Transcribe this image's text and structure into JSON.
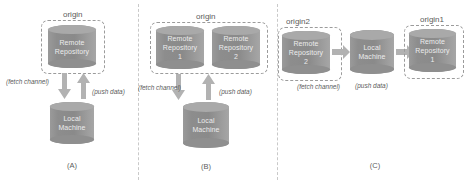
{
  "figure": {
    "background": "#ffffff",
    "cylinder_color": "#8a8a8a",
    "cylinder_text_color": "#ececed",
    "arrow_color": "#b2b2b2",
    "dashed_color": "#9b9b9b",
    "label_color": "#5b5b5b"
  },
  "panels": [
    {
      "caption": "(A)",
      "group_label": "origin",
      "nodes": [
        {
          "name": "remote-repository",
          "line1": "Remote",
          "line2": "Repository",
          "line3": ""
        },
        {
          "name": "local-machine",
          "line1": "Local",
          "line2": "Machine",
          "line3": ""
        }
      ],
      "arrows": [
        {
          "name": "fetch-arrow",
          "label": "(fetch channel)",
          "direction": "down"
        },
        {
          "name": "push-arrow",
          "label": "(push data)",
          "direction": "up"
        }
      ]
    },
    {
      "caption": "(B)",
      "group_label": "origin",
      "nodes": [
        {
          "name": "remote-repository-1",
          "line1": "Remote",
          "line2": "Repository",
          "line3": "1"
        },
        {
          "name": "remote-repository-2",
          "line1": "Remote",
          "line2": "Repository",
          "line3": "2"
        },
        {
          "name": "local-machine",
          "line1": "Local",
          "line2": "Machine",
          "line3": ""
        }
      ],
      "arrows": [
        {
          "name": "fetch-arrow",
          "label": "(fetch channel)",
          "direction": "down"
        },
        {
          "name": "push-arrow",
          "label": "(push data)",
          "direction": "up"
        }
      ]
    },
    {
      "caption": "(C)",
      "group_label_left": "origin2",
      "group_label_right": "origin1",
      "nodes": [
        {
          "name": "remote-repository-2",
          "line1": "Remote",
          "line2": "Repository",
          "line3": "2"
        },
        {
          "name": "local-machine",
          "line1": "Local",
          "line2": "Machine",
          "line3": ""
        },
        {
          "name": "remote-repository-1",
          "line1": "Remote",
          "line2": "Repository",
          "line3": "1"
        }
      ],
      "arrows": [
        {
          "name": "fetch-arrow",
          "label": "(fetch channel)",
          "direction": "right"
        },
        {
          "name": "push-arrow",
          "label": "(push data)",
          "direction": "right"
        }
      ]
    }
  ]
}
